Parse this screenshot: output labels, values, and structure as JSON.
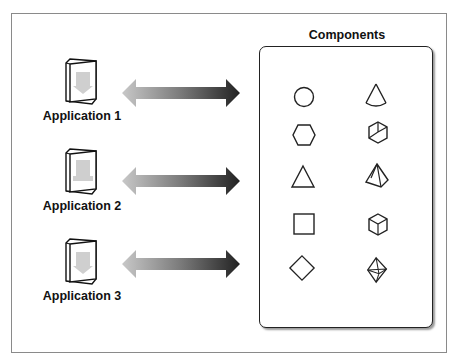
{
  "diagram": {
    "title": "Components",
    "applications": [
      {
        "label": "Application 1",
        "icon": "application-box-icon"
      },
      {
        "label": "Application 2",
        "icon": "application-box-icon"
      },
      {
        "label": "Application 3",
        "icon": "application-box-icon"
      }
    ],
    "connector": {
      "type": "double-headed-arrow",
      "gradient": [
        "#c8c8c8",
        "#2a2a2a"
      ]
    },
    "components": [
      {
        "row": 1,
        "left": "circle",
        "right": "cone"
      },
      {
        "row": 2,
        "left": "hexagon",
        "right": "cube-wireframe"
      },
      {
        "row": 3,
        "left": "triangle",
        "right": "pyramid"
      },
      {
        "row": 4,
        "left": "square",
        "right": "cube"
      },
      {
        "row": 5,
        "left": "diamond",
        "right": "octahedron"
      }
    ],
    "colors": {
      "stroke": "#222222",
      "frame": "#8a8a8a",
      "icon_fill": "#cfcfcf"
    }
  }
}
